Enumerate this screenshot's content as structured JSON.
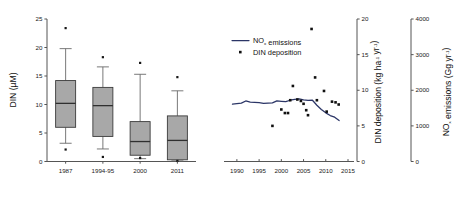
{
  "figure": {
    "background": "#ffffff",
    "line_color": "#2b3566",
    "box_fill": "#a8a8a8",
    "marker_color": "#101010"
  },
  "chart_data": [
    {
      "type": "box",
      "panel": "left",
      "title": "",
      "xlabel": "",
      "ylabel": "DIN (µM)",
      "ylim": [
        0,
        25
      ],
      "yticks": [
        0,
        5,
        10,
        15,
        20,
        25
      ],
      "ytick_labels": [
        "0",
        "5",
        "10",
        "15",
        "20",
        "25"
      ],
      "grid": false,
      "categories": [
        "1987",
        "1994-95",
        "2000",
        "2011"
      ],
      "boxes": [
        {
          "category": "1987",
          "whisker_low": 3.2,
          "q1": 6.0,
          "median": 10.2,
          "q3": 14.2,
          "whisker_high": 19.8,
          "outliers": [
            2.1,
            23.4
          ]
        },
        {
          "category": "1994-95",
          "whisker_low": 2.2,
          "q1": 4.4,
          "median": 9.8,
          "q3": 13.0,
          "whisker_high": 16.6,
          "outliers": [
            0.8,
            18.3
          ]
        },
        {
          "category": "2000",
          "whisker_low": 0.5,
          "q1": 1.1,
          "median": 3.5,
          "q3": 7.0,
          "whisker_high": 15.3,
          "outliers": [
            0.6,
            17.3
          ]
        },
        {
          "category": "2011",
          "whisker_low": 0.1,
          "q1": 0.3,
          "median": 3.7,
          "q3": 8.0,
          "whisker_high": 12.4,
          "outliers": [
            0.1,
            14.8
          ]
        }
      ]
    },
    {
      "type": "line",
      "panel": "right",
      "title": "",
      "xlabel": "",
      "xlim": [
        1988,
        2015
      ],
      "xticks": [
        1990,
        1995,
        2000,
        2005,
        2010,
        2015
      ],
      "xtick_labels": [
        "1990",
        "1995",
        "2000",
        "2005",
        "2010",
        "2015"
      ],
      "grid": false,
      "axes": [
        {
          "id": "din-deposition",
          "label_parts": [
            "DIN deposition (kg ha",
            "-1",
            " yr",
            "-1",
            ")"
          ],
          "label_plain": "DIN deposition (kg ha-1 yr-1)",
          "lim": [
            0,
            20
          ],
          "ticks": [
            0,
            5,
            10,
            15,
            20
          ],
          "tick_labels": [
            "0",
            "5",
            "10",
            "15",
            "20"
          ]
        },
        {
          "id": "nox-emissions",
          "label_parts": [
            "NO",
            "x",
            " emissions (Gg yr",
            "-1",
            ")"
          ],
          "label_plain": "NOx emissions (Gg yr-1)",
          "lim": [
            0,
            4000
          ],
          "ticks": [
            0,
            1000,
            2000,
            3000,
            4000
          ],
          "tick_labels": [
            "0",
            "1000",
            "2000",
            "3000",
            "4000"
          ]
        }
      ],
      "legend": {
        "position": "upper-left",
        "entries": [
          {
            "marker": "line",
            "label_parts": [
              "NO",
              "x",
              " emissions"
            ],
            "label_plain": "NOx emissions"
          },
          {
            "marker": "dot",
            "label_parts": [
              "DIN deposition"
            ],
            "label_plain": "DIN deposition"
          }
        ]
      },
      "series": [
        {
          "name": "NOx emissions",
          "axis": "nox-emissions",
          "units": "Gg yr-1",
          "x": [
            1989,
            1990,
            1991,
            1992,
            1993,
            1994,
            1995,
            1996,
            1997,
            1998,
            1999,
            2000,
            2001,
            2002,
            2003,
            2004,
            2005,
            2006,
            2007,
            2008,
            2009,
            2010,
            2011,
            2012,
            2013
          ],
          "values": [
            1610,
            1625,
            1640,
            1700,
            1665,
            1660,
            1650,
            1630,
            1640,
            1645,
            1700,
            1690,
            1680,
            1720,
            1745,
            1760,
            1730,
            1715,
            1720,
            1580,
            1460,
            1365,
            1290,
            1245,
            1150
          ]
        },
        {
          "name": "DIN deposition",
          "axis": "din-deposition",
          "units": "kg ha-1 yr-1",
          "marker": "dot",
          "points": [
            {
              "x": 1998,
              "y": 5.0
            },
            {
              "x": 2000,
              "y": 7.3
            },
            {
              "x": 2000.8,
              "y": 6.8
            },
            {
              "x": 2001.5,
              "y": 6.8
            },
            {
              "x": 2002,
              "y": 8.6
            },
            {
              "x": 2002.6,
              "y": 10.6
            },
            {
              "x": 2003.6,
              "y": 8.7
            },
            {
              "x": 2004.4,
              "y": 8.5
            },
            {
              "x": 2005,
              "y": 8.1
            },
            {
              "x": 2005.6,
              "y": 7.2
            },
            {
              "x": 2006,
              "y": 6.5
            },
            {
              "x": 2006.8,
              "y": 18.6
            },
            {
              "x": 2007.6,
              "y": 11.8
            },
            {
              "x": 2008,
              "y": 8.6
            },
            {
              "x": 2009.6,
              "y": 9.9
            },
            {
              "x": 2010.2,
              "y": 7.0
            },
            {
              "x": 2011.4,
              "y": 8.4
            },
            {
              "x": 2012.2,
              "y": 8.3
            },
            {
              "x": 2012.9,
              "y": 8.0
            }
          ]
        }
      ]
    }
  ]
}
